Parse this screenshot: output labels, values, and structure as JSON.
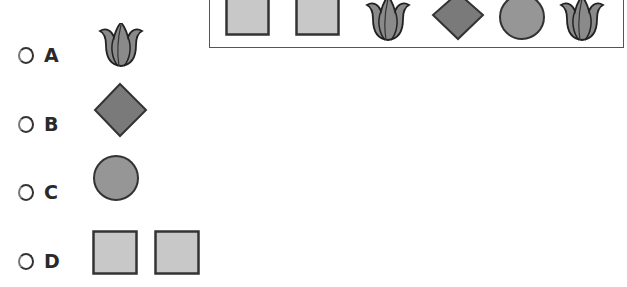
{
  "colors": {
    "square_fill": "#c8c8c8",
    "diamond_fill": "#7a7a7a",
    "circle_fill": "#969696",
    "tulip_fill": "#8a8a8a",
    "outline": "#333333"
  },
  "sequence": {
    "items": [
      {
        "shape": "square"
      },
      {
        "shape": "square"
      },
      {
        "shape": "tulip"
      },
      {
        "shape": "diamond"
      },
      {
        "shape": "circle"
      },
      {
        "shape": "tulip"
      }
    ]
  },
  "options": [
    {
      "letter": "A",
      "shapes": [
        "tulip"
      ]
    },
    {
      "letter": "B",
      "shapes": [
        "diamond"
      ]
    },
    {
      "letter": "C",
      "shapes": [
        "circle"
      ]
    },
    {
      "letter": "D",
      "shapes": [
        "square",
        "square"
      ]
    }
  ]
}
